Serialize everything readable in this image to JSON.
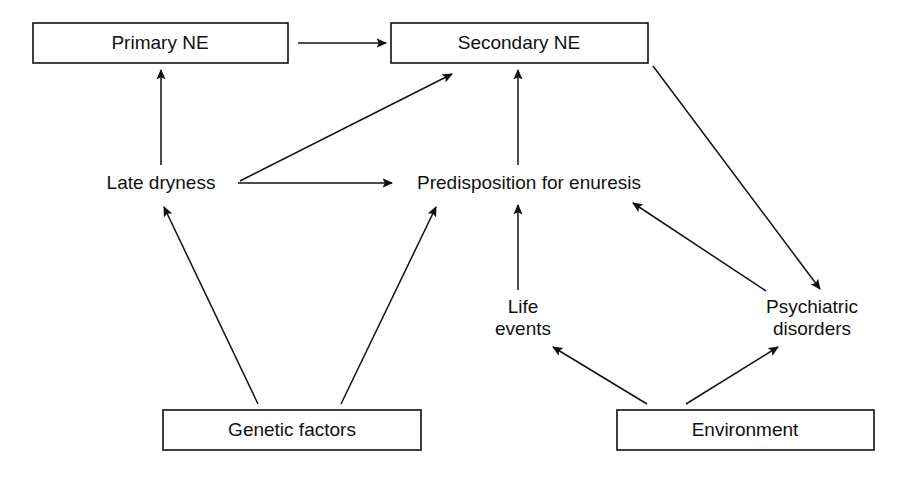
{
  "diagram": {
    "type": "flowchart",
    "canvas": {
      "width": 905,
      "height": 477
    },
    "colors": {
      "background": "#ffffff",
      "line": "#111111",
      "text": "#111111",
      "box_fill": "#ffffff"
    },
    "nodes": [
      {
        "id": "primary-ne",
        "label": "Primary NE",
        "shape": "rectangle",
        "x": 33,
        "y": 23,
        "width": 255,
        "height": 40,
        "cx": 160,
        "cy": 43
      },
      {
        "id": "secondary-ne",
        "label": "Secondary NE",
        "shape": "rectangle",
        "x": 391,
        "y": 23,
        "width": 257,
        "height": 40,
        "cx": 519,
        "cy": 43
      },
      {
        "id": "late-dryness",
        "label": "Late dryness",
        "shape": "text",
        "cx": 161,
        "cy": 183
      },
      {
        "id": "predisposition",
        "label": "Predisposition for enuresis",
        "shape": "text",
        "cx": 529,
        "cy": 183
      },
      {
        "id": "life-events",
        "label_line1": "Life",
        "label_line2": "events",
        "shape": "text",
        "cx": 523,
        "cy": 319
      },
      {
        "id": "psychiatric-disorders",
        "label_line1": "Psychiatric",
        "label_line2": "disorders",
        "shape": "text",
        "cx": 812,
        "cy": 319
      },
      {
        "id": "genetic-factors",
        "label": "Genetic factors",
        "shape": "rectangle",
        "x": 163,
        "y": 410,
        "width": 258,
        "height": 40,
        "cx": 292,
        "cy": 430
      },
      {
        "id": "environment",
        "label": "Environment",
        "shape": "rectangle",
        "x": 617,
        "y": 410,
        "width": 257,
        "height": 40,
        "cx": 745,
        "cy": 430
      }
    ],
    "edges": [
      {
        "id": "primary-to-secondary",
        "from": "primary-ne",
        "to": "secondary-ne",
        "x1": 298,
        "y1": 43,
        "x2": 386,
        "y2": 43
      },
      {
        "id": "late-dryness-to-primary",
        "from": "late-dryness",
        "to": "primary-ne",
        "x1": 161,
        "y1": 165,
        "x2": 161,
        "y2": 70
      },
      {
        "id": "late-dryness-to-secondary",
        "from": "late-dryness",
        "to": "secondary-ne",
        "x1": 240,
        "y1": 181,
        "x2": 452,
        "y2": 74
      },
      {
        "id": "late-dryness-to-predisposition",
        "from": "late-dryness",
        "to": "predisposition",
        "x1": 238,
        "y1": 183,
        "x2": 392,
        "y2": 183
      },
      {
        "id": "predisposition-to-secondary",
        "from": "predisposition",
        "to": "secondary-ne",
        "x1": 518,
        "y1": 165,
        "x2": 518,
        "y2": 70
      },
      {
        "id": "secondary-to-psychiatric",
        "from": "secondary-ne",
        "to": "psychiatric-disorders",
        "x1": 653,
        "y1": 66,
        "x2": 820,
        "y2": 289
      },
      {
        "id": "psychiatric-to-predisposition",
        "from": "psychiatric-disorders",
        "to": "predisposition",
        "x1": 766,
        "y1": 291,
        "x2": 633,
        "y2": 203
      },
      {
        "id": "life-events-to-predisposition",
        "from": "life-events",
        "to": "predisposition",
        "x1": 518,
        "y1": 290,
        "x2": 518,
        "y2": 205
      },
      {
        "id": "genetic-to-late-dryness",
        "from": "genetic-factors",
        "to": "late-dryness",
        "x1": 258,
        "y1": 404,
        "x2": 164,
        "y2": 207
      },
      {
        "id": "genetic-to-predisposition",
        "from": "genetic-factors",
        "to": "predisposition",
        "x1": 341,
        "y1": 404,
        "x2": 436,
        "y2": 207
      },
      {
        "id": "environment-to-life-events",
        "from": "environment",
        "to": "life-events",
        "x1": 647,
        "y1": 404,
        "x2": 553,
        "y2": 347
      },
      {
        "id": "environment-to-psychiatric",
        "from": "environment",
        "to": "psychiatric-disorders",
        "x1": 686,
        "y1": 404,
        "x2": 778,
        "y2": 347
      }
    ]
  }
}
